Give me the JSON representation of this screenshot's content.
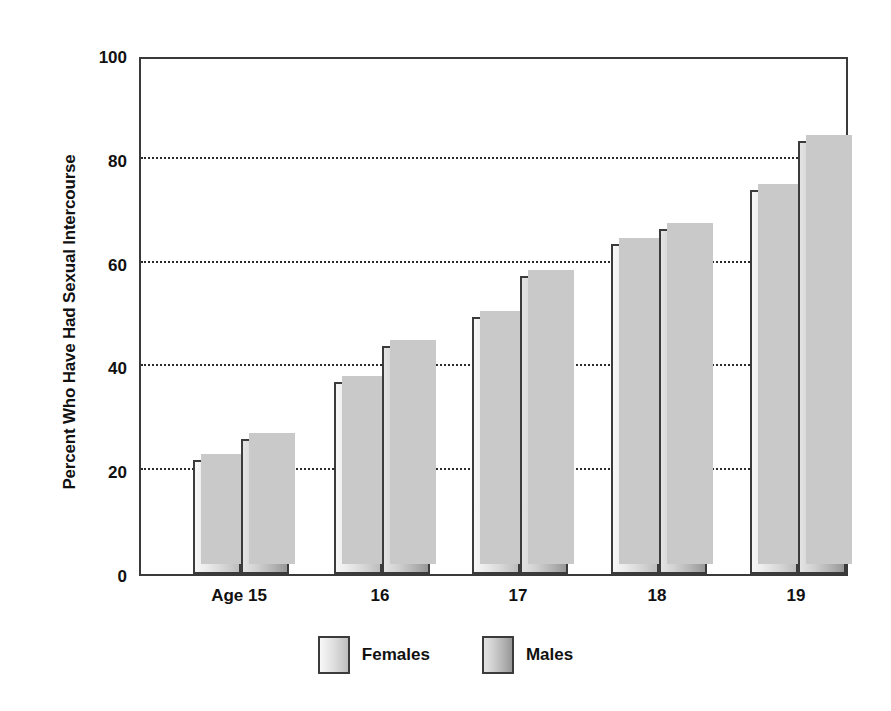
{
  "chart_data": {
    "type": "bar",
    "title": "",
    "subtitle": "",
    "xlabel": "",
    "ylabel": "Percent Who Have Had Sexual Intercourse",
    "categories": [
      "Age 15",
      "16",
      "17",
      "18",
      "19"
    ],
    "series": [
      {
        "name": "Females",
        "values": [
          22,
          37,
          49.5,
          63.5,
          74
        ],
        "color": "#d8d8d8"
      },
      {
        "name": "Males",
        "values": [
          26,
          44,
          57.5,
          66.5,
          83.5
        ],
        "color": "#a8a8a8"
      }
    ],
    "ylim": [
      0,
      100
    ],
    "y_ticks": [
      0,
      20,
      40,
      60,
      80,
      100
    ],
    "y_tick_labels": [
      "0",
      "20",
      "40",
      "60",
      "80",
      "100"
    ],
    "grid": true,
    "grid_style": "dotted-horizontal",
    "legend_position": "bottom-center",
    "legend_entries": [
      "Females",
      "Males"
    ],
    "bar_style": "grouped-gradient-with-shadow",
    "frame_color": "#3a3a3a",
    "background": "#ffffff"
  },
  "axes": {
    "y_title": "Percent Who Have Had Sexual Intercourse",
    "y_tick_labels": [
      "100",
      "80",
      "60",
      "40",
      "20",
      "0"
    ],
    "x_tick_labels": [
      "Age 15",
      "16",
      "17",
      "18",
      "19"
    ]
  },
  "legend": {
    "items": [
      {
        "label": "Females"
      },
      {
        "label": "Males"
      }
    ]
  }
}
